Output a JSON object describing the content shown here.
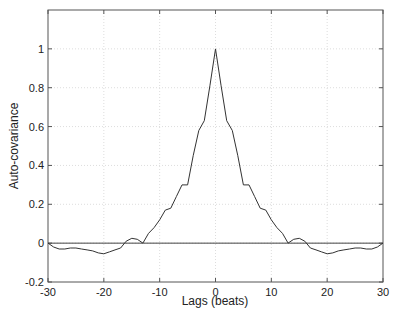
{
  "chart_data": {
    "type": "line",
    "title": "",
    "xlabel": "Lags (beats)",
    "ylabel": "Auto-covariance",
    "xlim": [
      -30,
      30
    ],
    "ylim": [
      -0.2,
      1.2
    ],
    "xticks": [
      -30,
      -20,
      -10,
      0,
      10,
      20,
      30
    ],
    "yticks": [
      -0.2,
      0,
      0.2,
      0.4,
      0.6,
      0.8,
      1
    ],
    "xtick_labels": [
      "-30",
      "-20",
      "-10",
      "0",
      "10",
      "20",
      "30"
    ],
    "ytick_labels": [
      "-0.2",
      "0",
      "0.2",
      "0.4",
      "0.6",
      "0.8",
      "1"
    ],
    "grid": true,
    "legend": null,
    "reference_lines": [
      {
        "type": "horizontal",
        "y": 0
      }
    ],
    "series": [
      {
        "name": "Auto-covariance",
        "color": "#333333",
        "x": [
          -30,
          -29,
          -28,
          -27,
          -26,
          -25,
          -24,
          -23,
          -22,
          -21,
          -20,
          -19,
          -18,
          -17,
          -16,
          -15,
          -14,
          -13,
          -12,
          -11,
          -10,
          -9,
          -8,
          -7,
          -6,
          -5,
          -4,
          -3,
          -2,
          -1,
          0,
          1,
          2,
          3,
          4,
          5,
          6,
          7,
          8,
          9,
          10,
          11,
          12,
          13,
          14,
          15,
          16,
          17,
          18,
          19,
          20,
          21,
          22,
          23,
          24,
          25,
          26,
          27,
          28,
          29,
          30
        ],
        "values": [
          0,
          -0.02,
          -0.03,
          -0.03,
          -0.025,
          -0.025,
          -0.03,
          -0.035,
          -0.04,
          -0.05,
          -0.055,
          -0.045,
          -0.035,
          -0.025,
          0.01,
          0.025,
          0.02,
          0.0,
          0.05,
          0.08,
          0.12,
          0.17,
          0.18,
          0.24,
          0.3,
          0.3,
          0.45,
          0.58,
          0.63,
          0.81,
          1.0,
          0.81,
          0.63,
          0.58,
          0.45,
          0.3,
          0.3,
          0.24,
          0.18,
          0.17,
          0.12,
          0.08,
          0.05,
          0.0,
          0.02,
          0.025,
          0.01,
          -0.025,
          -0.035,
          -0.045,
          -0.055,
          -0.05,
          -0.04,
          -0.035,
          -0.03,
          -0.025,
          -0.025,
          -0.03,
          -0.03,
          -0.02,
          0
        ]
      }
    ]
  }
}
